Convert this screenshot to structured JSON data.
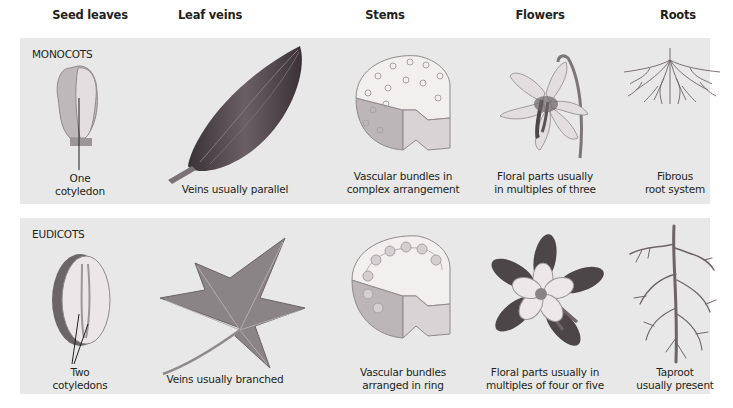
{
  "columns": [
    {
      "id": "seed-leaves",
      "label": "Seed leaves"
    },
    {
      "id": "leaf-veins",
      "label": "Leaf veins"
    },
    {
      "id": "stems",
      "label": "Stems"
    },
    {
      "id": "flowers",
      "label": "Flowers"
    },
    {
      "id": "roots",
      "label": "Roots"
    }
  ],
  "groups": [
    {
      "label": "MONOCOTS",
      "cells": [
        {
          "caption": [
            "One",
            "cotyledon"
          ],
          "icon": "monocot-seed-icon"
        },
        {
          "caption": [
            "Veins usually parallel"
          ],
          "icon": "parallel-vein-leaf-icon"
        },
        {
          "caption": [
            "Vascular bundles in",
            "complex arrangement"
          ],
          "icon": "scattered-bundle-stem-icon"
        },
        {
          "caption": [
            "Floral parts usually",
            "in multiples of three"
          ],
          "icon": "lily-flower-icon"
        },
        {
          "caption": [
            "Fibrous",
            "root system"
          ],
          "icon": "fibrous-root-icon"
        }
      ]
    },
    {
      "label": "EUDICOTS",
      "cells": [
        {
          "caption": [
            "Two",
            "cotyledons"
          ],
          "icon": "eudicot-seed-icon"
        },
        {
          "caption": [
            "Veins usually branched"
          ],
          "icon": "branched-vein-leaf-icon"
        },
        {
          "caption": [
            "Vascular bundles",
            "arranged in ring"
          ],
          "icon": "ring-bundle-stem-icon"
        },
        {
          "caption": [
            "Floral parts usually in",
            "multiples of four or five"
          ],
          "icon": "columbine-flower-icon"
        },
        {
          "caption": [
            "Taproot",
            "usually present"
          ],
          "icon": "taproot-icon"
        }
      ]
    }
  ],
  "colors": {
    "panel_bg": "#e8e8e8",
    "text": "#231f20",
    "leaf_dark": "#4a4046",
    "leaf_gray": "#8a8487",
    "root": "#6e6468",
    "flower_light": "#e6e2e4",
    "flower_dark": "#4c4648"
  }
}
